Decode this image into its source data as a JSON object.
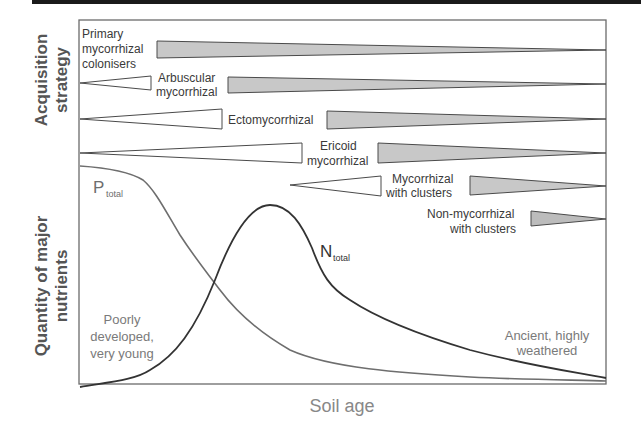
{
  "diagram": {
    "type": "conceptual-diagram",
    "y_axis_upper_title": [
      "Acquisition",
      "strategy"
    ],
    "y_axis_lower_title": [
      "Quantity of major",
      "nutrients"
    ],
    "x_axis_title": "Soil age",
    "strategies": [
      {
        "id": "primary",
        "label": [
          "Primary",
          "mycorrhizal",
          "colonisers"
        ],
        "rise_end": null,
        "decline_start": 0.146,
        "note": "dominant at youngest soils, declining with age"
      },
      {
        "id": "arbuscular",
        "label": [
          "Arbuscular",
          "mycorrhizal"
        ],
        "rise_end": 0.135,
        "decline_start": 0.281
      },
      {
        "id": "ecto",
        "label": [
          "Ectomycorrhizal"
        ],
        "rise_end": 0.271,
        "decline_start": 0.47
      },
      {
        "id": "ericoid",
        "label": [
          "Ericoid",
          "mycorrhizal"
        ],
        "rise_end": 0.423,
        "decline_start": 0.567
      },
      {
        "id": "myc-clusters",
        "label": [
          "Mycorrhizal",
          "with clusters"
        ],
        "rise_start": 0.4,
        "rise_end": 0.573,
        "decline_start": 0.742
      },
      {
        "id": "nonmyc-clusters",
        "label": [
          "Non-mycorrhizal",
          "with clusters"
        ],
        "rise_end": null,
        "decline_start": 0.858
      }
    ],
    "curves": [
      {
        "id": "p-total",
        "label_main": "P",
        "label_sub": "total",
        "trend": "high at young soils, sigmoidal decline to near zero"
      },
      {
        "id": "n-total",
        "label_main": "N",
        "label_sub": "total",
        "trend": "low at young soils, peaks at intermediate age, then declines"
      }
    ],
    "annotations": {
      "young": [
        "Poorly",
        "developed,",
        "very young"
      ],
      "old": [
        "Ancient, highly",
        "weathered"
      ]
    },
    "colors": {
      "frame": "#6b6b6b",
      "filled_wedge": "#c8c8c8",
      "wedge_stroke": "#4a4a4a",
      "p_curve": "#6e6e6e",
      "n_curve": "#333333"
    }
  }
}
